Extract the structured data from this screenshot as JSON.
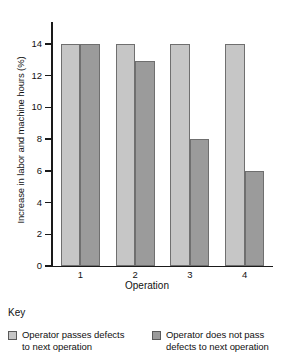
{
  "chart_data": {
    "type": "bar",
    "title": "",
    "xlabel": "Operation",
    "ylabel": "Increase in labor and machine hours (%)",
    "categories": [
      "1",
      "2",
      "3",
      "4"
    ],
    "ylim": [
      0,
      14
    ],
    "yticks": [
      0,
      2,
      4,
      6,
      8,
      10,
      12,
      14
    ],
    "ytick_labels": [
      "0",
      "2",
      "4",
      "6",
      "8",
      "10",
      "12",
      "14"
    ],
    "grid": false,
    "legend_position": "below-plot",
    "series": [
      {
        "name": "Operator passes defects to next operation",
        "color": "#c6c6c6",
        "values": [
          14,
          14,
          14,
          14
        ]
      },
      {
        "name": "Operator does not pass defects to next operation",
        "color": "#9b9b9b",
        "values": [
          14,
          12.9,
          8,
          6
        ]
      }
    ]
  },
  "axes": {
    "y_title": "Increase in labor and\nmachine hours (%)",
    "x_title": "Operation",
    "y_tick_labels": [
      "14",
      "12",
      "10",
      "8",
      "6",
      "4",
      "2",
      "0"
    ],
    "x_tick_labels": [
      "1",
      "2",
      "3",
      "4"
    ]
  },
  "key": {
    "heading": "Key",
    "entries": [
      {
        "swatch_color": "#c6c6c6",
        "label": "Operator passes defects\nto next operation"
      },
      {
        "swatch_color": "#9b9b9b",
        "label": "Operator does not pass\ndefects to next operation"
      }
    ]
  },
  "colors": {
    "light_bar": "#c6c6c6",
    "dark_bar": "#9b9b9b",
    "bar_edge": "#6f6f6f",
    "axis": "#1a1a1a",
    "background": "#ffffff"
  }
}
